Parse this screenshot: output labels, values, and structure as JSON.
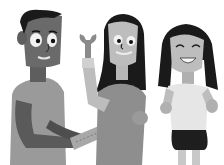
{
  "illustration": {
    "subject": "three cartoon people",
    "figures": [
      {
        "name": "man",
        "holding": "ruler"
      },
      {
        "name": "girl",
        "holding": "wrench"
      },
      {
        "name": "smiling-girl",
        "holding": ""
      }
    ],
    "palette": {
      "background": "#ffffff",
      "dark": "#1a1a1a",
      "skin_dark": "#6a6a6a",
      "mid": "#8c8c8c",
      "light": "#bdbdbd",
      "lighter": "#d6d6d6",
      "white": "#f2f2f2"
    }
  }
}
